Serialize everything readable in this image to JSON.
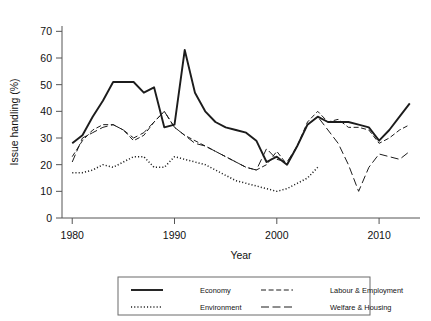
{
  "chart_data": {
    "type": "line",
    "title": "",
    "xlabel": "Year",
    "ylabel": "Issue handling (%)",
    "xlim": [
      1979,
      2014
    ],
    "ylim": [
      0,
      72
    ],
    "xticks": [
      1980,
      1990,
      2000,
      2010
    ],
    "yticks": [
      0,
      10,
      20,
      30,
      40,
      50,
      60,
      70
    ],
    "grid": false,
    "legend_position": "bottom",
    "series": [
      {
        "name": "Economy",
        "style": "solid",
        "x": [
          1980,
          1981,
          1982,
          1983,
          1984,
          1985,
          1986,
          1987,
          1988,
          1989,
          1990,
          1991,
          1992,
          1993,
          1994,
          1995,
          1996,
          1997,
          1998,
          1999,
          2000,
          2001,
          2002,
          2003,
          2004,
          2005,
          2006,
          2007,
          2008,
          2009,
          2010,
          2011,
          2012,
          2013
        ],
        "values": [
          28,
          31,
          38,
          44,
          51,
          51,
          51,
          47,
          49,
          34,
          35,
          63,
          47,
          40,
          36,
          34,
          33,
          32,
          29,
          21,
          23,
          20,
          27,
          35,
          38,
          36,
          36,
          36,
          35,
          34,
          29,
          33,
          38,
          43
        ]
      },
      {
        "name": "Labour & Employment",
        "style": "dashed",
        "x": [
          1980,
          1981,
          1982,
          1983,
          1984,
          1985,
          1986,
          1987,
          1988,
          1989,
          1990,
          1991,
          1992,
          1993,
          1994,
          1995,
          1996,
          1997,
          1998,
          1999,
          2000,
          2001,
          2002,
          2003,
          2004,
          2005,
          2006,
          2007,
          2008,
          2009,
          2010,
          2011,
          2012,
          2013
        ],
        "values": [
          23,
          29,
          33,
          35,
          35,
          33,
          29,
          31,
          36,
          40,
          34,
          31,
          29,
          27,
          25,
          23,
          21,
          19,
          18,
          20,
          25,
          20,
          27,
          36,
          40,
          36,
          37,
          34,
          34,
          33,
          28,
          30,
          33,
          35
        ]
      },
      {
        "name": "Environment",
        "style": "dotted",
        "x": [
          1980,
          1981,
          1982,
          1983,
          1984,
          1985,
          1986,
          1987,
          1988,
          1989,
          1990,
          1991,
          1992,
          1993,
          1994,
          1995,
          1996,
          1997,
          1998,
          1999,
          2000,
          2001,
          2002,
          2003,
          2004
        ],
        "values": [
          17,
          17,
          18,
          20,
          19,
          21,
          23,
          23,
          19,
          19,
          23,
          22,
          21,
          20,
          18,
          16,
          14,
          13,
          12,
          11,
          10,
          11,
          13,
          15,
          19
        ]
      },
      {
        "name": "Welfare & Housing",
        "style": "longdash",
        "x": [
          1980,
          1981,
          1982,
          1983,
          1984,
          1985,
          1986,
          1987,
          1988,
          1989,
          1990,
          1991,
          1992,
          1993,
          1994,
          1995,
          1996,
          1997,
          1998,
          1999,
          2000,
          2001,
          2002,
          2003,
          2004,
          2005,
          2006,
          2007,
          2008,
          2009,
          2010,
          2011,
          2012,
          2013
        ],
        "values": [
          21,
          30,
          32,
          34,
          35,
          33,
          30,
          32,
          36,
          40,
          34,
          31,
          28,
          27,
          25,
          23,
          21,
          19,
          18,
          26,
          22,
          21,
          27,
          35,
          38,
          33,
          28,
          20,
          10,
          19,
          24,
          23,
          22,
          25
        ]
      }
    ]
  },
  "axes": {
    "y_title": "Issue handling (%)",
    "x_title": "Year",
    "y_tick_labels": [
      "0",
      "10",
      "20",
      "30",
      "40",
      "50",
      "60",
      "70"
    ],
    "x_tick_labels": [
      "1980",
      "1990",
      "2000",
      "2010"
    ]
  },
  "legend": {
    "entries": [
      {
        "label": "Economy",
        "style": "solid"
      },
      {
        "label": "Labour & Employment",
        "style": "dashed"
      },
      {
        "label": "Environment",
        "style": "dotted"
      },
      {
        "label": "Welfare & Housing",
        "style": "longdash"
      }
    ]
  },
  "colors": {
    "ink": "#1c1c1c",
    "axis": "#555555",
    "background": "#ffffff"
  }
}
